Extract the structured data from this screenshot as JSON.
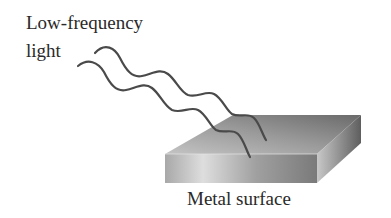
{
  "labels": {
    "light_line1": "Low-frequency",
    "light_line2": "light",
    "metal": "Metal surface"
  },
  "colors": {
    "wave_stroke": "#4a4a4a",
    "text": "#2a2a2a",
    "top_face_dark": "#6e6e6e",
    "top_face_light": "#b8b8b8",
    "front_face_light": "#d8d8d8",
    "front_face_dark": "#888888",
    "side_face_light": "#bdbdbd",
    "side_face_dark": "#6a6a6a"
  },
  "diagram": {
    "waves": 2
  }
}
